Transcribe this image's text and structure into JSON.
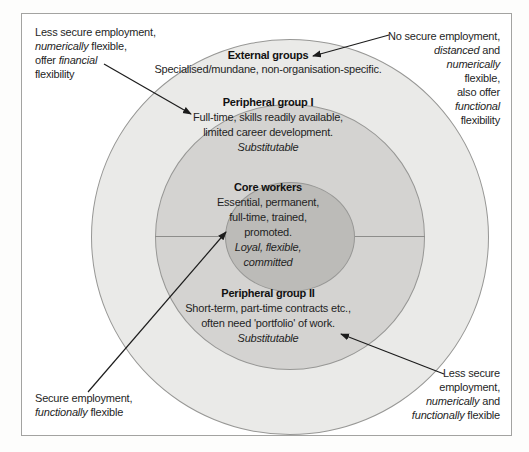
{
  "colors": {
    "page_bg": "#fdfdfc",
    "frame_border": "#a3a3a1",
    "outer_ring": "#eaeae8",
    "middle_ring": "#d4d3d1",
    "core_fill": "#bcbbb8",
    "circle_outline": "#979795",
    "divider": "#8d8d8b",
    "text": "#1f1f1f",
    "heading": "#111111",
    "arrow": "#1c1c1c"
  },
  "rings": {
    "external": {
      "title": "External groups",
      "lines": [
        [
          {
            "t": "Specialised/mundane, non-organisation-specific.",
            "i": false
          }
        ]
      ]
    },
    "peripheral1": {
      "title": "Peripheral group I",
      "lines": [
        [
          {
            "t": "Full-time, skills readily available,",
            "i": false
          }
        ],
        [
          {
            "t": "limited career development.",
            "i": false
          }
        ],
        [
          {
            "t": "Substitutable",
            "i": true
          }
        ]
      ]
    },
    "core": {
      "title": "Core workers",
      "lines": [
        [
          {
            "t": "Essential, permanent,",
            "i": false
          }
        ],
        [
          {
            "t": "full-time, trained,",
            "i": false
          }
        ],
        [
          {
            "t": "promoted.",
            "i": false
          }
        ],
        [
          {
            "t": "Loyal, flexible,",
            "i": true
          }
        ],
        [
          {
            "t": "committed",
            "i": true
          }
        ]
      ]
    },
    "peripheral2": {
      "title": "Peripheral group II",
      "lines": [
        [
          {
            "t": "Short-term, part-time contracts etc.,",
            "i": false
          }
        ],
        [
          {
            "t": "often need 'portfolio' of work.",
            "i": false
          }
        ],
        [
          {
            "t": "Substitutable",
            "i": true
          }
        ]
      ]
    }
  },
  "annotations": {
    "top_left": {
      "lines": [
        [
          {
            "t": "Less secure employment,",
            "i": false
          }
        ],
        [
          {
            "t": "numerically",
            "i": true
          },
          {
            "t": " flexible,",
            "i": false
          }
        ],
        [
          {
            "t": "offer ",
            "i": false
          },
          {
            "t": "financial",
            "i": true
          }
        ],
        [
          {
            "t": "flexibility",
            "i": false
          }
        ]
      ]
    },
    "top_right": {
      "lines": [
        [
          {
            "t": "No secure employment,",
            "i": false
          }
        ],
        [
          {
            "t": "distanced",
            "i": true
          },
          {
            "t": " and",
            "i": false
          }
        ],
        [
          {
            "t": "numerically",
            "i": true
          }
        ],
        [
          {
            "t": "flexible,",
            "i": false
          }
        ],
        [
          {
            "t": "also offer",
            "i": false
          }
        ],
        [
          {
            "t": "functional",
            "i": true
          }
        ],
        [
          {
            "t": "flexibility",
            "i": false
          }
        ]
      ]
    },
    "bottom_left": {
      "lines": [
        [
          {
            "t": "Secure employment,",
            "i": false
          }
        ],
        [
          {
            "t": "functionally",
            "i": true
          },
          {
            "t": " flexible",
            "i": false
          }
        ]
      ]
    },
    "bottom_right": {
      "lines": [
        [
          {
            "t": "Less secure",
            "i": false
          }
        ],
        [
          {
            "t": "employment,",
            "i": false
          }
        ],
        [
          {
            "t": "numerically",
            "i": true
          },
          {
            "t": " and",
            "i": false
          }
        ],
        [
          {
            "t": "functionally",
            "i": true
          },
          {
            "t": " flexible",
            "i": false
          }
        ]
      ]
    }
  },
  "arrows": [
    {
      "name": "arrow-to-peripheral1",
      "x1": 104,
      "y1": 64,
      "x2": 191,
      "y2": 114
    },
    {
      "name": "arrow-to-external",
      "x1": 389,
      "y1": 35,
      "x2": 313,
      "y2": 56
    },
    {
      "name": "arrow-to-core",
      "x1": 88,
      "y1": 392,
      "x2": 226,
      "y2": 232
    },
    {
      "name": "arrow-to-peripheral2",
      "x1": 444,
      "y1": 374,
      "x2": 341,
      "y2": 334
    }
  ]
}
